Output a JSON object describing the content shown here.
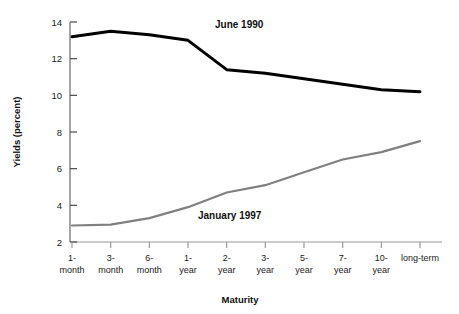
{
  "chart_data": {
    "type": "line",
    "title": "",
    "xlabel": "Maturity",
    "ylabel": "Yields (percent)",
    "categories": [
      "1-\nmonth",
      "3-\nmonth",
      "6-\nmonth",
      "1-\nyear",
      "2-\nyear",
      "3-\nyear",
      "5-\nyear",
      "7-\nyear",
      "10-\nyear",
      "long-term"
    ],
    "category_lines": [
      [
        "1-",
        "month"
      ],
      [
        "3-",
        "month"
      ],
      [
        "6-",
        "month"
      ],
      [
        "1-",
        "year"
      ],
      [
        "2-",
        "year"
      ],
      [
        "3-",
        "year"
      ],
      [
        "5-",
        "year"
      ],
      [
        "7-",
        "year"
      ],
      [
        "10-",
        "year"
      ],
      [
        "long-term",
        ""
      ]
    ],
    "ylim": [
      2,
      14
    ],
    "yticks": [
      2,
      4,
      6,
      8,
      10,
      12,
      14
    ],
    "ytick_labels": [
      "2",
      "4",
      "6",
      "8",
      "10",
      "12",
      "14"
    ],
    "grid": false,
    "legend_position": "inline-annotation",
    "series": [
      {
        "name": "June 1990",
        "color": "#000000",
        "width": 3.0,
        "values": [
          13.2,
          13.5,
          13.3,
          13.0,
          11.4,
          11.2,
          10.9,
          10.6,
          10.3,
          10.2
        ],
        "annotation": {
          "text": "June 1990",
          "x_px": 215,
          "y_px": 28
        }
      },
      {
        "name": "January 1997",
        "color": "#808080",
        "width": 2.2,
        "values": [
          2.9,
          2.95,
          3.3,
          3.9,
          4.7,
          5.1,
          5.8,
          6.5,
          6.9,
          7.5
        ],
        "annotation": {
          "text": "January 1997",
          "x_px": 198,
          "y_px": 219
        }
      }
    ]
  },
  "axes": {
    "y_axis_label": "Yields (percent)",
    "x_axis_label": "Maturity"
  }
}
